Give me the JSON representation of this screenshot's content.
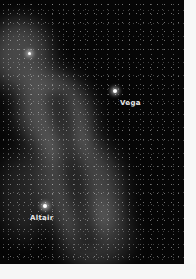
{
  "image": {
    "subject": "Milky Way star field",
    "labels": [
      {
        "name": "Vega",
        "star_x": 115,
        "star_y": 91,
        "label_x": 120,
        "label_y": 100
      },
      {
        "name": "Altair",
        "star_x": 45,
        "star_y": 206,
        "label_x": 30,
        "label_y": 215
      }
    ],
    "bright_star": {
      "x": 29,
      "y": 53
    }
  }
}
